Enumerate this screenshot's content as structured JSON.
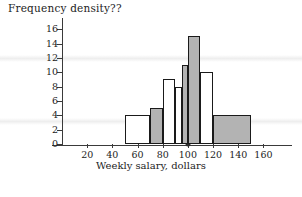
{
  "chart_data": {
    "type": "bar",
    "title": "Frequency density??",
    "xlabel": "Weekly salary, dollars",
    "ylabel": "",
    "xlim": [
      0,
      170
    ],
    "ylim": [
      0,
      17
    ],
    "xticks": [
      20,
      40,
      60,
      80,
      100,
      120,
      140,
      160
    ],
    "yticks": [
      0,
      2,
      4,
      6,
      8,
      10,
      12,
      14,
      16
    ],
    "grid": false,
    "legend": "none",
    "bin_edges": [
      50,
      70,
      80,
      90,
      95,
      100,
      110,
      120,
      150
    ],
    "values": [
      4,
      5,
      9,
      8,
      11,
      15,
      10,
      4
    ],
    "bars": [
      {
        "x0": 50,
        "x1": 70,
        "height": 4,
        "fill": "white"
      },
      {
        "x0": 70,
        "x1": 80,
        "height": 5,
        "fill": "gray"
      },
      {
        "x0": 80,
        "x1": 90,
        "height": 9,
        "fill": "white"
      },
      {
        "x0": 90,
        "x1": 95,
        "height": 8,
        "fill": "white"
      },
      {
        "x0": 95,
        "x1": 100,
        "height": 11,
        "fill": "gray"
      },
      {
        "x0": 100,
        "x1": 110,
        "height": 15,
        "fill": "gray"
      },
      {
        "x0": 110,
        "x1": 120,
        "height": 10,
        "fill": "white"
      },
      {
        "x0": 120,
        "x1": 150,
        "height": 4,
        "fill": "gray"
      }
    ],
    "annotations": [
      {
        "name": "axis-marker-dot",
        "x": 100,
        "y": 0
      }
    ],
    "colors": {
      "bar_fill_gray": "#b3b3b3",
      "bar_fill_white": "#ffffff",
      "bar_outline": "#1a1a1a",
      "axis": "#3a3a3a",
      "text": "#1c1c1c"
    }
  }
}
